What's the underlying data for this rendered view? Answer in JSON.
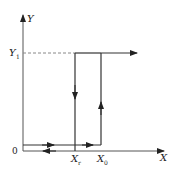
{
  "diagram": {
    "type": "hysteresis-loop",
    "axes": {
      "x_label": "X",
      "y_label": "Y",
      "origin_label": "0"
    },
    "levels": {
      "y1_label": "Y",
      "y1_sub": "1"
    },
    "thresholds": {
      "xr_label": "X",
      "xr_sub": "r",
      "x0_label": "X",
      "x0_sub": "0"
    },
    "colors": {
      "line": "#333333",
      "dashed": "#888888"
    }
  }
}
